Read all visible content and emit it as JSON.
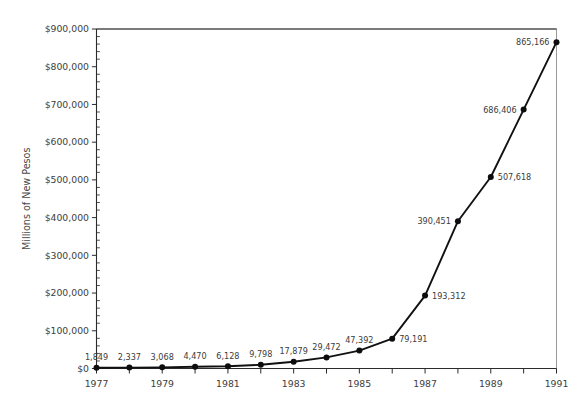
{
  "chart_data": {
    "type": "line",
    "title": "",
    "xlabel": "",
    "ylabel": "Millions of New Pesos",
    "x": [
      1977,
      1978,
      1979,
      1980,
      1981,
      1982,
      1983,
      1984,
      1985,
      1986,
      1987,
      1988,
      1989,
      1990,
      1991
    ],
    "values": [
      1849,
      2337,
      3068,
      4470,
      6128,
      9798,
      17879,
      29472,
      47392,
      79191,
      193312,
      390451,
      507618,
      686406,
      865166
    ],
    "point_labels": [
      "1,849",
      "2,337",
      "3,068",
      "4,470",
      "6,128",
      "9,798",
      "17,879",
      "29,472",
      "47,392",
      "79,191",
      "193,312",
      "390,451",
      "507,618",
      "686,406",
      "865,166"
    ],
    "label_side": [
      "above",
      "above",
      "above",
      "above",
      "above",
      "above",
      "above",
      "above",
      "above",
      "right",
      "right",
      "left",
      "right",
      "left",
      "left"
    ],
    "xlim": [
      1977,
      1991
    ],
    "ylim": [
      0,
      900000
    ],
    "ytick_labels": [
      "$0",
      "$100,000",
      "$200,000",
      "$300,000",
      "$400,000",
      "$500,000",
      "$600,000",
      "$700,000",
      "$800,000",
      "$900,000"
    ],
    "ytick_values": [
      0,
      100000,
      200000,
      300000,
      400000,
      500000,
      600000,
      700000,
      800000,
      900000
    ],
    "y_minor_interval": 20000,
    "xtick_labels": [
      "1977",
      "",
      "1979",
      "",
      "1981",
      "",
      "1983",
      "",
      "1985",
      "",
      "1987",
      "",
      "1989",
      "",
      "1991"
    ],
    "xtick_values": [
      1977,
      1978,
      1979,
      1980,
      1981,
      1982,
      1983,
      1984,
      1985,
      1986,
      1987,
      1988,
      1989,
      1990,
      1991
    ],
    "grid": false,
    "legend": false,
    "marker": "circle",
    "line_color": "#111111",
    "marker_color": "#0d0d0d",
    "background": "#ffffff"
  }
}
